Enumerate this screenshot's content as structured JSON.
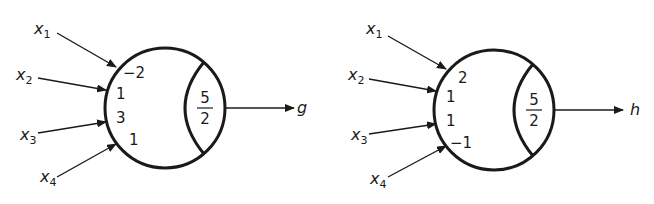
{
  "neurons": [
    {
      "id": "g",
      "output_label": "g",
      "inputs": [
        {
          "var": "x",
          "sub": "1",
          "weight": "−2"
        },
        {
          "var": "x",
          "sub": "2",
          "weight": "1"
        },
        {
          "var": "x",
          "sub": "3",
          "weight": "3"
        },
        {
          "var": "x",
          "sub": "4",
          "weight": "1"
        }
      ],
      "threshold": {
        "numerator": "5",
        "denominator": "2"
      }
    },
    {
      "id": "h",
      "output_label": "h",
      "inputs": [
        {
          "var": "x",
          "sub": "1",
          "weight": "2"
        },
        {
          "var": "x",
          "sub": "2",
          "weight": "1"
        },
        {
          "var": "x",
          "sub": "3",
          "weight": "1"
        },
        {
          "var": "x",
          "sub": "4",
          "weight": "−1"
        }
      ],
      "threshold": {
        "numerator": "5",
        "denominator": "2"
      }
    }
  ],
  "colors": {
    "stroke": "#1a1a1a",
    "background": "#ffffff"
  }
}
